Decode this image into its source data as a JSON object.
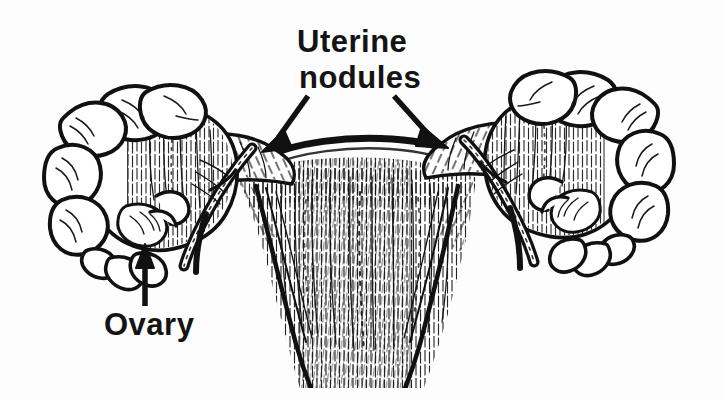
{
  "figure": {
    "title": "Uterine nodules",
    "style": "black-and-white pen-and-ink medical line illustration",
    "background_color": "#fdfdfd",
    "ink_color": "#111111",
    "width": 722,
    "height": 400
  },
  "labels": {
    "uterine_nodules": {
      "line1": "Uterine",
      "line2": "nodules",
      "full": "Uterine nodules",
      "x": 297,
      "y": 26
    },
    "ovary": {
      "text": "Ovary",
      "x": 104,
      "y": 309
    }
  },
  "annotations": {
    "arrows": [
      {
        "name": "arrow-to-left-nodule",
        "from_label": "Uterine nodules",
        "points_to": "left uterine nodule",
        "start": [
          307,
          96
        ],
        "end": [
          268,
          146
        ],
        "direction": "down-left"
      },
      {
        "name": "arrow-to-right-nodule",
        "from_label": "Uterine nodules",
        "points_to": "right uterine nodule",
        "start": [
          396,
          96
        ],
        "end": [
          446,
          142
        ],
        "direction": "down-right"
      },
      {
        "name": "arrow-to-ovary",
        "from_label": "Ovary",
        "points_to": "left ovary",
        "start": [
          145,
          305
        ],
        "end": [
          143,
          248
        ],
        "direction": "up"
      }
    ]
  },
  "anatomy_parts": [
    "left uterine nodule",
    "right uterine nodule",
    "uterine fundus",
    "uterine body",
    "left fallopian tube",
    "right fallopian tube",
    "left fimbriae",
    "right fimbriae",
    "left ovary",
    "right ovary",
    "broad ligament"
  ]
}
